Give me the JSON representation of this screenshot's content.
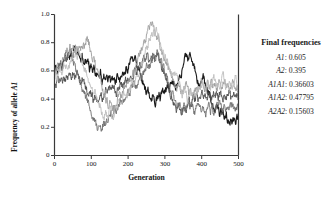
{
  "chart_data": {
    "type": "line",
    "title": "",
    "xlabel": "Generation",
    "ylabel": "Frequency of allele A1",
    "xlim": [
      0,
      500
    ],
    "ylim": [
      0,
      1.0
    ],
    "xticks": [
      "0",
      "100",
      "200",
      "300",
      "400",
      "500"
    ],
    "xtick_values": [
      0,
      100,
      200,
      300,
      400,
      500
    ],
    "yticks": [
      "0",
      "0.2",
      "0.4",
      "0.6",
      "0.8",
      "1.0"
    ],
    "ytick_values": [
      0,
      0.2,
      0.4,
      0.6,
      0.8,
      1.0
    ],
    "grid": false,
    "legend_position": "right-outside",
    "series": [
      {
        "name": "replicate-1",
        "color": "#1a1a1a",
        "width": 1.1,
        "seed": 11,
        "start": 0.6,
        "end": 0.26,
        "values": [
          0.6,
          0.62,
          0.58,
          0.63,
          0.66,
          0.62,
          0.68,
          0.71,
          0.67,
          0.72,
          0.7,
          0.75,
          0.71,
          0.76,
          0.73,
          0.69,
          0.72,
          0.67,
          0.7,
          0.65,
          0.68,
          0.63,
          0.66,
          0.61,
          0.64,
          0.59,
          0.62,
          0.57,
          0.6,
          0.56,
          0.59,
          0.54,
          0.57,
          0.53,
          0.56,
          0.52,
          0.55,
          0.51,
          0.54,
          0.5,
          0.53,
          0.56,
          0.52,
          0.55,
          0.59,
          0.56,
          0.6,
          0.64,
          0.61,
          0.66,
          0.7,
          0.67,
          0.72,
          0.68,
          0.64,
          0.6,
          0.57,
          0.53,
          0.5,
          0.47,
          0.44,
          0.47,
          0.44,
          0.41,
          0.44,
          0.41,
          0.38,
          0.41,
          0.44,
          0.41,
          0.44,
          0.47,
          0.44,
          0.47,
          0.5,
          0.47,
          0.5,
          0.53,
          0.5,
          0.47,
          0.5,
          0.53,
          0.56,
          0.6,
          0.64,
          0.67,
          0.71,
          0.68,
          0.72,
          0.69,
          0.65,
          0.62,
          0.58,
          0.55,
          0.52,
          0.49,
          0.52,
          0.55,
          0.52,
          0.49,
          0.46,
          0.43,
          0.4,
          0.37,
          0.34,
          0.31,
          0.34,
          0.31,
          0.28,
          0.31,
          0.28,
          0.25,
          0.28,
          0.25,
          0.23,
          0.26,
          0.24,
          0.27,
          0.25,
          0.28,
          0.26
        ]
      },
      {
        "name": "replicate-2",
        "color": "#4d4d4d",
        "width": 0.9,
        "seed": 27,
        "start": 0.52,
        "end": 0.4,
        "values": [
          0.52,
          0.5,
          0.54,
          0.51,
          0.55,
          0.52,
          0.56,
          0.53,
          0.57,
          0.54,
          0.58,
          0.55,
          0.59,
          0.56,
          0.6,
          0.57,
          0.54,
          0.51,
          0.55,
          0.52,
          0.49,
          0.46,
          0.43,
          0.46,
          0.43,
          0.4,
          0.43,
          0.4,
          0.37,
          0.4,
          0.43,
          0.4,
          0.43,
          0.46,
          0.43,
          0.46,
          0.49,
          0.46,
          0.49,
          0.46,
          0.43,
          0.46,
          0.49,
          0.52,
          0.49,
          0.52,
          0.55,
          0.52,
          0.55,
          0.58,
          0.55,
          0.58,
          0.61,
          0.58,
          0.62,
          0.65,
          0.62,
          0.66,
          0.69,
          0.66,
          0.7,
          0.67,
          0.71,
          0.68,
          0.72,
          0.69,
          0.73,
          0.7,
          0.66,
          0.63,
          0.6,
          0.57,
          0.54,
          0.51,
          0.48,
          0.45,
          0.42,
          0.39,
          0.36,
          0.33,
          0.36,
          0.33,
          0.3,
          0.33,
          0.36,
          0.33,
          0.36,
          0.39,
          0.36,
          0.39,
          0.42,
          0.39,
          0.42,
          0.39,
          0.42,
          0.45,
          0.42,
          0.45,
          0.42,
          0.39,
          0.42,
          0.39,
          0.42,
          0.45,
          0.42,
          0.45,
          0.42,
          0.45,
          0.42,
          0.39,
          0.42,
          0.39,
          0.42,
          0.45,
          0.42,
          0.39,
          0.42,
          0.39,
          0.42,
          0.4
        ]
      },
      {
        "name": "replicate-3",
        "color": "#6e6e6e",
        "width": 0.9,
        "seed": 43,
        "start": 0.57,
        "end": 0.33,
        "values": [
          0.57,
          0.61,
          0.58,
          0.62,
          0.66,
          0.63,
          0.67,
          0.71,
          0.68,
          0.72,
          0.75,
          0.71,
          0.68,
          0.64,
          0.61,
          0.57,
          0.54,
          0.5,
          0.47,
          0.44,
          0.41,
          0.38,
          0.35,
          0.32,
          0.29,
          0.26,
          0.23,
          0.2,
          0.18,
          0.21,
          0.19,
          0.22,
          0.25,
          0.22,
          0.25,
          0.28,
          0.31,
          0.28,
          0.31,
          0.34,
          0.31,
          0.34,
          0.37,
          0.4,
          0.37,
          0.4,
          0.43,
          0.46,
          0.43,
          0.46,
          0.49,
          0.52,
          0.49,
          0.52,
          0.55,
          0.58,
          0.55,
          0.58,
          0.61,
          0.64,
          0.61,
          0.64,
          0.67,
          0.7,
          0.67,
          0.7,
          0.73,
          0.7,
          0.67,
          0.64,
          0.61,
          0.58,
          0.55,
          0.52,
          0.49,
          0.46,
          0.43,
          0.4,
          0.37,
          0.34,
          0.37,
          0.34,
          0.31,
          0.34,
          0.31,
          0.34,
          0.37,
          0.34,
          0.37,
          0.34,
          0.31,
          0.34,
          0.37,
          0.34,
          0.31,
          0.34,
          0.31,
          0.28,
          0.31,
          0.34,
          0.31,
          0.34,
          0.31,
          0.34,
          0.37,
          0.34,
          0.37,
          0.34,
          0.31,
          0.34,
          0.31,
          0.34,
          0.31,
          0.34,
          0.37,
          0.34,
          0.31,
          0.34,
          0.33
        ]
      },
      {
        "name": "replicate-4",
        "color": "#9c9c9c",
        "width": 0.9,
        "seed": 61,
        "start": 0.58,
        "end": 0.46,
        "values": [
          0.58,
          0.61,
          0.65,
          0.62,
          0.66,
          0.7,
          0.67,
          0.71,
          0.75,
          0.72,
          0.76,
          0.73,
          0.77,
          0.74,
          0.78,
          0.75,
          0.79,
          0.76,
          0.8,
          0.77,
          0.81,
          0.84,
          0.8,
          0.77,
          0.73,
          0.7,
          0.66,
          0.63,
          0.59,
          0.56,
          0.52,
          0.49,
          0.45,
          0.42,
          0.38,
          0.35,
          0.38,
          0.35,
          0.32,
          0.35,
          0.38,
          0.41,
          0.44,
          0.41,
          0.44,
          0.47,
          0.5,
          0.53,
          0.5,
          0.53,
          0.56,
          0.59,
          0.62,
          0.65,
          0.68,
          0.71,
          0.74,
          0.77,
          0.8,
          0.83,
          0.86,
          0.89,
          0.92,
          0.94,
          0.91,
          0.88,
          0.85,
          0.82,
          0.79,
          0.76,
          0.73,
          0.7,
          0.67,
          0.64,
          0.61,
          0.58,
          0.55,
          0.52,
          0.49,
          0.46,
          0.49,
          0.46,
          0.43,
          0.46,
          0.49,
          0.52,
          0.49,
          0.46,
          0.49,
          0.46,
          0.43,
          0.46,
          0.49,
          0.46,
          0.49,
          0.52,
          0.49,
          0.46,
          0.49,
          0.52,
          0.49,
          0.52,
          0.49,
          0.46,
          0.49,
          0.46,
          0.49,
          0.52,
          0.49,
          0.52,
          0.55,
          0.52,
          0.49,
          0.46,
          0.49,
          0.52,
          0.49,
          0.46,
          0.49,
          0.46
        ]
      },
      {
        "name": "replicate-5",
        "color": "#bdbdbd",
        "width": 0.9,
        "seed": 79,
        "start": 0.55,
        "end": 0.52,
        "values": [
          0.55,
          0.58,
          0.55,
          0.59,
          0.62,
          0.59,
          0.63,
          0.6,
          0.64,
          0.61,
          0.65,
          0.68,
          0.72,
          0.69,
          0.73,
          0.7,
          0.74,
          0.71,
          0.67,
          0.64,
          0.6,
          0.57,
          0.53,
          0.5,
          0.46,
          0.43,
          0.46,
          0.43,
          0.4,
          0.37,
          0.34,
          0.31,
          0.28,
          0.31,
          0.28,
          0.31,
          0.34,
          0.31,
          0.28,
          0.31,
          0.34,
          0.37,
          0.4,
          0.37,
          0.4,
          0.43,
          0.4,
          0.43,
          0.46,
          0.49,
          0.52,
          0.49,
          0.52,
          0.55,
          0.58,
          0.61,
          0.64,
          0.67,
          0.7,
          0.73,
          0.76,
          0.79,
          0.82,
          0.85,
          0.88,
          0.85,
          0.88,
          0.85,
          0.82,
          0.79,
          0.76,
          0.73,
          0.7,
          0.67,
          0.64,
          0.61,
          0.58,
          0.55,
          0.58,
          0.55,
          0.52,
          0.49,
          0.46,
          0.43,
          0.46,
          0.43,
          0.4,
          0.43,
          0.46,
          0.43,
          0.4,
          0.43,
          0.46,
          0.49,
          0.46,
          0.49,
          0.52,
          0.49,
          0.46,
          0.49,
          0.52,
          0.49,
          0.52,
          0.55,
          0.52,
          0.49,
          0.52,
          0.49,
          0.52,
          0.55,
          0.52,
          0.49,
          0.52,
          0.55,
          0.52,
          0.49,
          0.52,
          0.55,
          0.52,
          0.52
        ]
      }
    ]
  },
  "legend": {
    "title": "Final frequencies",
    "rows": [
      {
        "genotype": "A1",
        "value": "0.605"
      },
      {
        "genotype": "A2",
        "value": "0.395"
      },
      {
        "genotype": "A1A1",
        "value": "0.36603"
      },
      {
        "genotype": "A1A2",
        "value": "0.47795"
      },
      {
        "genotype": "A2A2",
        "value": "0.15603"
      }
    ]
  },
  "axes": {
    "y_title_prefix": "Frequency of allele ",
    "y_title_italic": "A1",
    "x_title": "Generation"
  }
}
